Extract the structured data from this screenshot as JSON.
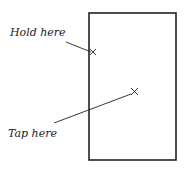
{
  "labels": {
    "hold": "Hold here",
    "tap": "Tap here"
  },
  "colors": {
    "ink": "#222222",
    "background": "#ffffff"
  }
}
